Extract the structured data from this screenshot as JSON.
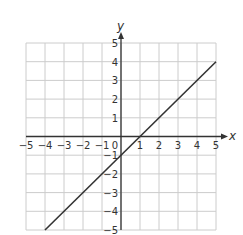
{
  "chart_data": {
    "type": "line",
    "title": "",
    "xlabel": "x",
    "ylabel": "y",
    "xlim": [
      -5,
      5
    ],
    "ylim": [
      -5,
      5
    ],
    "grid": true,
    "x_ticks": [
      "−5",
      "−4",
      "−3",
      "−2",
      "−1",
      "0",
      "1",
      "2",
      "3",
      "4",
      "5"
    ],
    "y_ticks": [
      "5",
      "4",
      "3",
      "2",
      "1",
      "−1",
      "−2",
      "−3",
      "−4",
      "−5"
    ],
    "series": [
      {
        "name": "y = x − 1",
        "x": [
          -4,
          5
        ],
        "y": [
          -5,
          4
        ],
        "color": "#333333"
      }
    ]
  },
  "colors": {
    "grid": "#cccccc",
    "axis": "#333333",
    "line": "#333333"
  }
}
